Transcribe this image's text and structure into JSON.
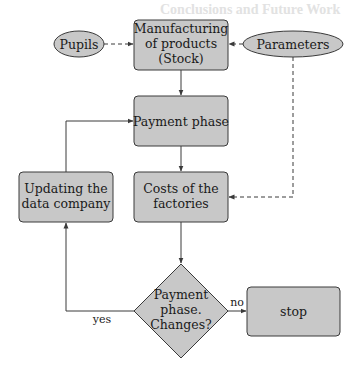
{
  "diagram": {
    "type": "flowchart",
    "background_heading": "Conclusions and Future Work",
    "colors": {
      "node_fill": "#c8c8c8",
      "stroke": "#3a3a3a",
      "text": "#1a1a1a"
    },
    "nodes": {
      "pupils": {
        "label": "Pupils",
        "shape": "ellipse"
      },
      "parameters": {
        "label": "Parameters",
        "shape": "ellipse"
      },
      "manufacturing": {
        "lines": [
          "Manufacturing",
          "of products",
          "(Stock)"
        ],
        "shape": "rounded-rect"
      },
      "payment": {
        "label": "Payment phase",
        "shape": "rounded-rect"
      },
      "updating": {
        "lines": [
          "Updating the",
          "data company"
        ],
        "shape": "rounded-rect"
      },
      "costs": {
        "lines": [
          "Costs of the",
          "factories"
        ],
        "shape": "rounded-rect"
      },
      "decision": {
        "lines": [
          "Payment",
          "phase.",
          "Changes?"
        ],
        "shape": "diamond"
      },
      "stop": {
        "label": "stop",
        "shape": "rounded-rect"
      }
    },
    "edge_labels": {
      "yes": "yes",
      "no": "no"
    },
    "edges": [
      {
        "from": "pupils",
        "to": "manufacturing",
        "style": "dashed"
      },
      {
        "from": "parameters",
        "to": "manufacturing",
        "style": "dashed"
      },
      {
        "from": "parameters",
        "to": "costs",
        "style": "dashed"
      },
      {
        "from": "manufacturing",
        "to": "payment",
        "style": "solid"
      },
      {
        "from": "payment",
        "to": "costs",
        "style": "solid"
      },
      {
        "from": "costs",
        "to": "decision",
        "style": "solid"
      },
      {
        "from": "decision",
        "to": "updating",
        "style": "solid",
        "label": "yes"
      },
      {
        "from": "updating",
        "to": "payment",
        "style": "solid"
      },
      {
        "from": "decision",
        "to": "stop",
        "style": "solid",
        "label": "no"
      }
    ]
  }
}
